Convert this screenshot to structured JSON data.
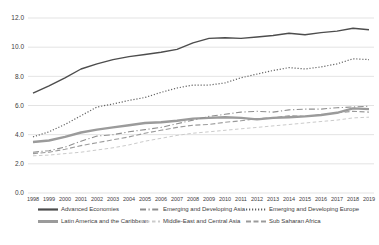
{
  "chart_data": {
    "type": "line",
    "title": "",
    "xlabel": "",
    "ylabel": "",
    "x": [
      1998,
      1999,
      2000,
      2001,
      2002,
      2003,
      2004,
      2005,
      2006,
      2007,
      2008,
      2009,
      2010,
      2011,
      2012,
      2013,
      2014,
      2015,
      2016,
      2017,
      2018,
      2019
    ],
    "ylim": [
      0,
      12
    ],
    "ytick_step": 2,
    "ytick_labels": [
      "12.0",
      "10.0",
      "8.0",
      "6.0",
      "4.0",
      "2.0",
      "0.0"
    ],
    "grid": "horizontal",
    "legend_position": "bottom",
    "series": [
      {
        "name": "Advanced Economies",
        "color": "#4d4d4d",
        "width": 1.4,
        "dash": "",
        "values": [
          6.85,
          7.35,
          7.9,
          8.5,
          8.85,
          9.15,
          9.35,
          9.5,
          9.65,
          9.85,
          10.3,
          10.6,
          10.65,
          10.6,
          10.7,
          10.8,
          10.95,
          10.85,
          11.0,
          11.1,
          11.3,
          11.2
        ]
      },
      {
        "name": "Emerging and Developing Asia",
        "color": "#8f8f8f",
        "width": 1.1,
        "dash": "6 2.5 1.2 2.5",
        "values": [
          2.8,
          2.9,
          3.15,
          3.55,
          3.9,
          4.0,
          4.2,
          4.35,
          4.5,
          4.75,
          5.0,
          5.25,
          5.4,
          5.55,
          5.6,
          5.55,
          5.7,
          5.75,
          5.75,
          5.85,
          5.9,
          5.95
        ]
      },
      {
        "name": "Emerging and Developing Europe",
        "color": "#636363",
        "width": 1.2,
        "dash": "1.2 1.8",
        "values": [
          3.85,
          4.2,
          4.7,
          5.3,
          5.9,
          6.1,
          6.35,
          6.55,
          6.9,
          7.2,
          7.4,
          7.4,
          7.55,
          7.9,
          8.15,
          8.4,
          8.6,
          8.5,
          8.65,
          8.85,
          9.2,
          9.15
        ]
      },
      {
        "name": "Latin America and the Caribbean",
        "color": "#9b9b9b",
        "width": 2.4,
        "dash": "",
        "values": [
          3.5,
          3.6,
          3.85,
          4.15,
          4.35,
          4.5,
          4.65,
          4.8,
          4.85,
          4.95,
          5.1,
          5.15,
          5.2,
          5.15,
          5.05,
          5.15,
          5.2,
          5.25,
          5.35,
          5.5,
          5.8,
          5.75
        ]
      },
      {
        "name": "Middle-East and Central Asia",
        "color": "#cbcbcb",
        "width": 1.0,
        "dash": "3.5 2.5",
        "values": [
          2.55,
          2.6,
          2.7,
          2.8,
          2.95,
          3.1,
          3.3,
          3.55,
          3.75,
          3.95,
          4.1,
          4.2,
          4.3,
          4.4,
          4.5,
          4.6,
          4.7,
          4.8,
          4.9,
          5.0,
          5.15,
          5.2
        ]
      },
      {
        "name": "Sub Saharan Africa",
        "color": "#9b9b9b",
        "width": 1.1,
        "dash": "5 2.5",
        "values": [
          2.7,
          2.8,
          3.0,
          3.25,
          3.45,
          3.65,
          3.85,
          4.1,
          4.3,
          4.5,
          4.65,
          4.7,
          4.85,
          4.95,
          5.1,
          5.15,
          5.3,
          5.25,
          5.35,
          5.5,
          5.6,
          5.55
        ]
      }
    ]
  },
  "colors": {
    "background": "#ffffff",
    "gridline": "#dcdcdc",
    "axis_text": "#404040"
  }
}
